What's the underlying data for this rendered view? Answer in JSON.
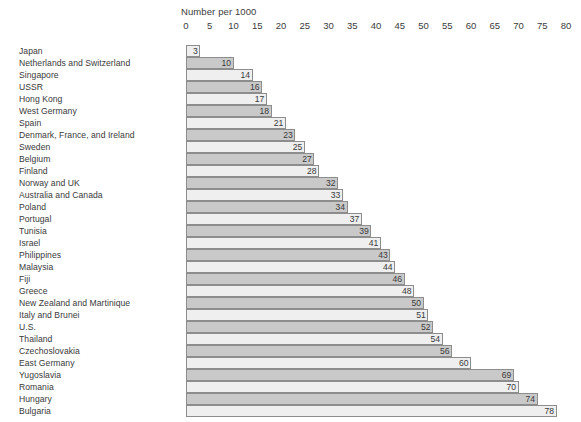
{
  "chart_data": {
    "type": "bar",
    "orientation": "horizontal",
    "title": "Number per 1000",
    "xlabel": "Number per 1000",
    "ylabel": "",
    "xlim": [
      0,
      80
    ],
    "xticks": [
      0,
      5,
      10,
      15,
      20,
      25,
      30,
      35,
      40,
      45,
      50,
      55,
      60,
      65,
      70,
      75,
      80
    ],
    "grid": false,
    "legend": "none",
    "value_labels": true,
    "categories": [
      "Japan",
      "Netherlands and Switzerland",
      "Singapore",
      "USSR",
      "Hong Kong",
      "West Germany",
      "Spain",
      "Denmark, France, and Ireland",
      "Sweden",
      "Belgium",
      "Finland",
      "Norway and UK",
      "Australia and Canada",
      "Poland",
      "Portugal",
      "Tunisia",
      "Israel",
      "Philippines",
      "Malaysia",
      "Fiji",
      "Greece",
      "New Zealand and Martinique",
      "Italy and Brunei",
      "U.S.",
      "Thailand",
      "Czechoslovakia",
      "East Germany",
      "Yugoslavia",
      "Romania",
      "Hungary",
      "Bulgaria"
    ],
    "values": [
      3,
      10,
      14,
      16,
      17,
      18,
      21,
      23,
      25,
      27,
      28,
      32,
      33,
      34,
      37,
      39,
      41,
      43,
      44,
      46,
      48,
      50,
      51,
      52,
      54,
      56,
      60,
      69,
      70,
      74,
      78
    ]
  },
  "style": {
    "bar_fill_light": "#efefef",
    "bar_fill_dark": "#c9c9c9",
    "bar_border": "#8d8d8d",
    "text_color": "#3a3a3a",
    "background": "#ffffff"
  }
}
